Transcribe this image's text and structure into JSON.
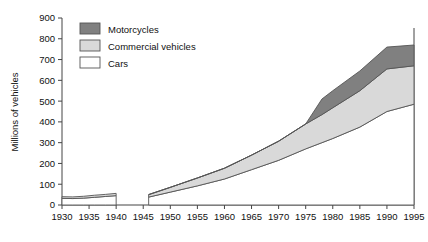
{
  "chart_data": {
    "type": "area",
    "stacked": true,
    "title": "",
    "subtitle": "",
    "xlabel": "",
    "ylabel": "Millions of vehicles",
    "xlim": [
      1930,
      1995
    ],
    "ylim": [
      0,
      900
    ],
    "grid": false,
    "legend_position": "top-left",
    "x_ticks": [
      1930,
      1935,
      1940,
      1945,
      1950,
      1955,
      1960,
      1965,
      1970,
      1975,
      1980,
      1985,
      1990,
      1995
    ],
    "y_ticks": [
      0,
      100,
      200,
      300,
      400,
      500,
      600,
      700,
      800,
      900
    ],
    "legend": [
      {
        "label": "Motorcycles",
        "color": "#808080"
      },
      {
        "label": "Commercial vehicles",
        "color": "#d9d9d9"
      },
      {
        "label": "Cars",
        "color": "#ffffff"
      }
    ],
    "segments": [
      {
        "name": "prewar",
        "x": [
          1930,
          1932,
          1934,
          1936,
          1938,
          1940
        ],
        "series": [
          {
            "name": "Cars",
            "values": [
              32,
              31,
              33,
              37,
              41,
              45
            ]
          },
          {
            "name": "Commercial vehicles",
            "values": [
              8,
              8,
              9,
              10,
              10,
              11
            ]
          },
          {
            "name": "Motorcycles",
            "values": [
              0,
              0,
              0,
              0,
              0,
              0
            ]
          }
        ]
      },
      {
        "name": "postwar",
        "x": [
          1946,
          1950,
          1955,
          1960,
          1965,
          1970,
          1975,
          1978,
          1980,
          1985,
          1990,
          1995
        ],
        "series": [
          {
            "name": "Cars",
            "values": [
              38,
              62,
              92,
              125,
              170,
              215,
              270,
              300,
              320,
              375,
              450,
              485
            ]
          },
          {
            "name": "Commercial vehicles",
            "values": [
              12,
              23,
              38,
              52,
              70,
              92,
              120,
              135,
              148,
              175,
              205,
              185
            ]
          },
          {
            "name": "Motorcycles",
            "values": [
              0,
              0,
              0,
              0,
              0,
              0,
              0,
              75,
              82,
              95,
              105,
              100
            ]
          }
        ]
      }
    ],
    "totals_1995": {
      "cars": 485,
      "commercial_vehicles": 670,
      "all_vehicles": 770
    }
  }
}
